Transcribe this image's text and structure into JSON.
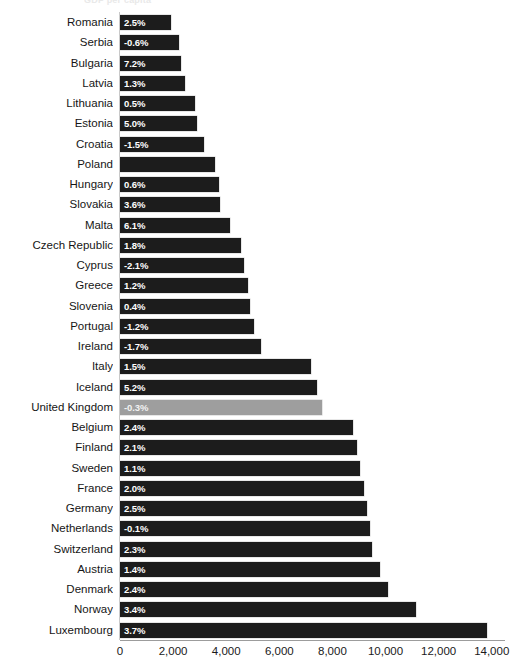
{
  "chart_data": {
    "type": "bar",
    "orientation": "horizontal",
    "title": "GDP per capita",
    "xlabel": "",
    "ylabel": "",
    "xlim": [
      0,
      14500
    ],
    "xticks": [
      "0",
      "2,000",
      "4,000",
      "6,000",
      "8,000",
      "10,000",
      "12,000",
      "14,000"
    ],
    "xtick_values": [
      0,
      2000,
      4000,
      6000,
      8000,
      10000,
      12000,
      14000
    ],
    "grid": false,
    "legend": "none",
    "highlight_category": "United Kingdom",
    "highlight_color": "#9e9e9e",
    "bar_color": "#1c1c1c",
    "categories": [
      "Romania",
      "Serbia",
      "Bulgaria",
      "Latvia",
      "Lithuania",
      "Estonia",
      "Croatia",
      "Poland",
      "Hungary",
      "Slovakia",
      "Malta",
      "Czech Republic",
      "Cyprus",
      "Greece",
      "Slovenia",
      "Portugal",
      "Ireland",
      "Italy",
      "Iceland",
      "United Kingdom",
      "Belgium",
      "Finland",
      "Sweden",
      "France",
      "Germany",
      "Netherlands",
      "Switzerland",
      "Austria",
      "Denmark",
      "Norway",
      "Luxembourg"
    ],
    "values": [
      1930,
      2220,
      2300,
      2440,
      2810,
      2890,
      3150,
      3560,
      3740,
      3780,
      4150,
      4560,
      4670,
      4810,
      4890,
      5040,
      5300,
      7190,
      7410,
      7590,
      8780,
      8930,
      9040,
      9190,
      9300,
      9410,
      9480,
      9780,
      10080,
      11150,
      13820
    ],
    "data_labels": [
      "2.5%",
      "-0.6%",
      "7.2%",
      "1.3%",
      "0.5%",
      "5.0%",
      "-1.5%",
      "",
      "0.6%",
      "3.6%",
      "6.1%",
      "1.8%",
      "-2.1%",
      "1.2%",
      "0.4%",
      "-1.2%",
      "-1.7%",
      "1.5%",
      "5.2%",
      "-0.3%",
      "2.4%",
      "2.1%",
      "1.1%",
      "2.0%",
      "2.5%",
      "-0.1%",
      "2.3%",
      "1.4%",
      "2.4%",
      "3.4%",
      "3.7%"
    ],
    "series_label_meaning": "growth rate shown inside each bar"
  }
}
